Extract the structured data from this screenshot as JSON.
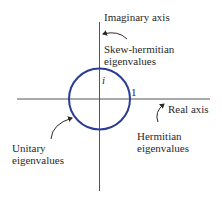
{
  "diagram": {
    "axes": {
      "vertical_label": "Imaginary axis",
      "horizontal_label": "Real axis"
    },
    "circle": {
      "top_label": "i",
      "right_label": "1",
      "color": "#2b3d96"
    },
    "annotations": {
      "skew_hermitian": [
        "Skew-hermitian",
        "eigenvalues"
      ],
      "hermitian": [
        "Hermitian",
        "eigenvalues"
      ],
      "unitary": [
        "Unitary",
        "eigenvalues"
      ]
    },
    "axis_color": "#555555"
  }
}
